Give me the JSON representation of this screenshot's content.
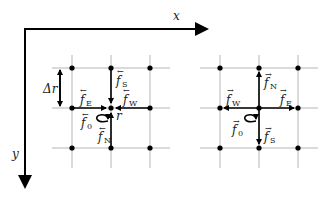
{
  "axes": {
    "x_label": "x",
    "y_label": "y"
  },
  "spacing_label": "Δr",
  "position_label": "r",
  "left_panel": {
    "accent": "←",
    "labels": [
      {
        "name": "f",
        "sub": "E"
      },
      {
        "name": "f",
        "sub": "W"
      },
      {
        "name": "f",
        "sub": "S"
      },
      {
        "name": "f",
        "sub": "N"
      },
      {
        "name": "f",
        "sub": "0"
      }
    ]
  },
  "right_panel": {
    "accent": "→",
    "labels": [
      {
        "name": "f",
        "sub": "W"
      },
      {
        "name": "f",
        "sub": "E"
      },
      {
        "name": "f",
        "sub": "N"
      },
      {
        "name": "f",
        "sub": "S"
      },
      {
        "name": "f",
        "sub": "0"
      }
    ]
  }
}
